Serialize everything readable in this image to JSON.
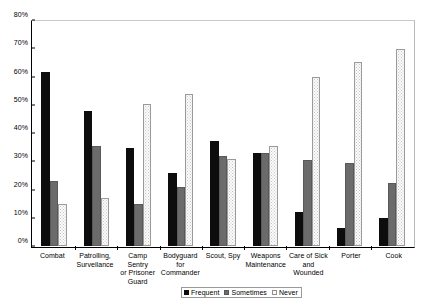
{
  "chart_data": {
    "type": "bar",
    "title": "",
    "xlabel": "",
    "ylabel": "",
    "ylim": [
      0,
      80
    ],
    "y_tick_labels": [
      "0%",
      "10%",
      "20%",
      "30%",
      "40%",
      "50%",
      "60%",
      "70%",
      "80%"
    ],
    "y_tick_values": [
      0,
      10,
      20,
      30,
      40,
      50,
      60,
      70,
      80
    ],
    "grid": false,
    "legend_position": "bottom",
    "categories": [
      "Combat",
      "Patrolling, Surveilance",
      "Camp Sentry or Prisoner Guard",
      "Bodyguard for Commander",
      "Scout, Spy",
      "Weapons Maintenance",
      "Care of Sick and Wounded",
      "Porter",
      "Cook"
    ],
    "category_lines": [
      [
        "Combat"
      ],
      [
        "Patrolling,",
        "Surveilance"
      ],
      [
        "Camp Sentry",
        "or Prisoner",
        "Guard"
      ],
      [
        "Bodyguard",
        "for",
        "Commander"
      ],
      [
        "Scout, Spy"
      ],
      [
        "Weapons",
        "Maintenance"
      ],
      [
        "Care of Sick",
        "and",
        "Wounded"
      ],
      [
        "Porter"
      ],
      [
        "Cook"
      ]
    ],
    "series": [
      {
        "name": "Frequent",
        "color": "#0d0d0d",
        "values": [
          62,
          48,
          35,
          26,
          37.5,
          33,
          12,
          6.5,
          10
        ]
      },
      {
        "name": "Sometimes",
        "color": "#6b6b6b",
        "values": [
          23,
          35.5,
          15,
          21,
          32,
          33,
          30.5,
          29.5,
          22.5
        ]
      },
      {
        "name": "Never",
        "color": "#fbfbfb",
        "values": [
          15,
          17,
          50.5,
          54,
          31,
          35.5,
          60,
          65.5,
          70
        ]
      }
    ]
  }
}
